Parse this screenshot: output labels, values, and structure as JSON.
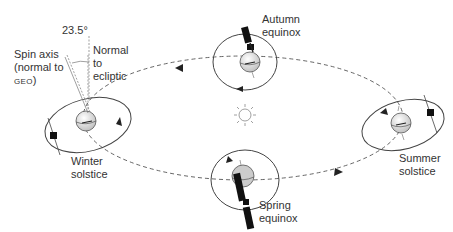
{
  "diagram": {
    "labels": {
      "angle": "23.5°",
      "spin_axis_line1": "Spin axis",
      "spin_axis_line2": "(normal to",
      "spin_axis_line3_sc": "GEO",
      "spin_axis_line3_end": ")",
      "normal_line1": "Normal",
      "normal_line2": "to",
      "normal_line3": "ecliptic",
      "autumn_line1": "Autumn",
      "autumn_line2": "equinox",
      "winter_line1": "Winter",
      "winter_line2": "solstice",
      "summer_line1": "Summer",
      "summer_line2": "solstice",
      "spring_line1": "Spring",
      "spring_line2": "equinox"
    },
    "positions": [
      {
        "name": "Winter solstice",
        "earth_x": 83,
        "earth_y": 123
      },
      {
        "name": "Autumn equinox",
        "earth_x": 245,
        "earth_y": 58
      },
      {
        "name": "Summer solstice",
        "earth_x": 400,
        "earth_y": 125
      },
      {
        "name": "Spring equinox",
        "earth_x": 245,
        "earth_y": 178
      }
    ],
    "center": {
      "name": "Sun",
      "x": 245,
      "y": 115
    },
    "colors": {
      "line": "#444444",
      "dashed": "#555555",
      "satellite": "#111111",
      "earth_fill": "#eeeeee",
      "earth_shade": "#bbbbbb",
      "sun": "#888888"
    }
  }
}
